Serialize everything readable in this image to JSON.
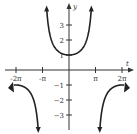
{
  "chart_data": {
    "type": "line",
    "title": "",
    "function": "y = sec(t/2)",
    "xlabel": "t",
    "ylabel": "y",
    "xlim": [
      -6.8,
      6.8
    ],
    "ylim": [
      -4.2,
      4.6
    ],
    "x_ticks": [
      "-2π",
      "-π",
      "π",
      "2π"
    ],
    "y_ticks": [
      "3",
      "2",
      "1",
      "-1",
      "-2",
      "-3"
    ],
    "asymptotes": [
      "-π",
      "π"
    ],
    "series": [
      {
        "name": "sec(t/2)",
        "domain": "[-2π, 2π]",
        "points_sample": [
          [
            -6.283,
            -1
          ],
          [
            0,
            1
          ],
          [
            6.283,
            -1
          ]
        ]
      }
    ],
    "grid": false,
    "legend": "none",
    "color": "#222222"
  }
}
